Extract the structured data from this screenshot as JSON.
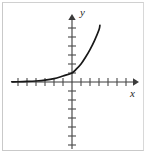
{
  "figure": {
    "kind": "math-graph",
    "caption": "",
    "frame_color": "#c9c9c9",
    "background": "#ffffff"
  },
  "axes": {
    "x_label": "x",
    "y_label": "y",
    "axis_color": "#3b3b3b",
    "tick_color": "#4a4a4a",
    "origin_px": {
      "x": 72,
      "y": 82
    },
    "tick_spacing_px": 9,
    "x_ticks_left": 6,
    "x_ticks_right": 6,
    "y_ticks_up": 6,
    "y_ticks_down": 7,
    "x_axis_start_px": 12,
    "x_axis_end_px": 138,
    "y_axis_top_px": 14,
    "y_axis_bottom_px": 149,
    "arrows": [
      "x-positive",
      "y-positive"
    ]
  },
  "chart_data": {
    "type": "line",
    "title": "",
    "xlabel": "x",
    "ylabel": "y",
    "grid": false,
    "legend": null,
    "xlim": [
      -6.7,
      7.3
    ],
    "ylim": [
      -7.4,
      7.5
    ],
    "series": [
      {
        "name": "exponential growth",
        "equation": "y = a*b^x, b > 1",
        "curve_color": "#181818",
        "asymptote": "y = 0 (horizontal, to the left)",
        "x": [
          -6.7,
          -6.0,
          -5.0,
          -4.0,
          -3.0,
          -2.0,
          -1.0,
          0.0,
          0.5,
          1.0,
          1.5,
          2.0,
          2.5,
          3.0,
          3.1
        ],
        "y": [
          0.02,
          0.03,
          0.06,
          0.11,
          0.2,
          0.37,
          0.67,
          1.0,
          1.45,
          2.0,
          2.75,
          3.6,
          4.6,
          5.8,
          6.3
        ]
      }
    ]
  }
}
